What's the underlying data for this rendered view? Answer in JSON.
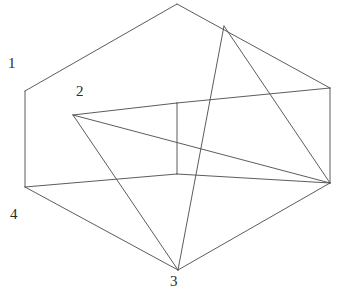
{
  "figure": {
    "type": "line-diagram",
    "canvas": {
      "width": 337,
      "height": 296,
      "background": "#ffffff"
    },
    "stroke_color": "#4a4a4a",
    "label_color": "#2b2b2b",
    "labels": [
      {
        "id": "label-1",
        "text": "1",
        "x": 8,
        "y": 56
      },
      {
        "id": "label-2",
        "text": "2",
        "x": 76,
        "y": 84
      },
      {
        "id": "label-3",
        "text": "3",
        "x": 170,
        "y": 274
      },
      {
        "id": "label-4",
        "text": "4",
        "x": 10,
        "y": 207
      }
    ],
    "vertices": {
      "top_apex": [
        177,
        4
      ],
      "outer_left_top": [
        25,
        91
      ],
      "outer_right_top": [
        330,
        88
      ],
      "outer_left_bottom": [
        25,
        187
      ],
      "outer_right_bottom": [
        330,
        183
      ],
      "bottom_apex": [
        178,
        270
      ],
      "inner_top": [
        177,
        103
      ],
      "inner_bottom": [
        177,
        174
      ],
      "rim_left_point": [
        73,
        115
      ],
      "rim_right_point": [
        224,
        26
      ]
    },
    "polylines": [
      {
        "name": "rim-top-left",
        "points": "25,91 177,4"
      },
      {
        "name": "rim-top-right",
        "points": "177,4 330,88"
      },
      {
        "name": "rim-left-vertical",
        "points": "25,91 25,187"
      },
      {
        "name": "rim-right-vertical",
        "points": "330,88 330,183"
      },
      {
        "name": "base-left",
        "points": "25,187 178,270"
      },
      {
        "name": "base-right",
        "points": "178,270 330,183"
      },
      {
        "name": "inner-rim-left",
        "points": "73,115 177,103"
      },
      {
        "name": "inner-rim-right",
        "points": "177,103 330,88"
      },
      {
        "name": "inner-floor-left",
        "points": "25,187 177,174"
      },
      {
        "name": "inner-floor-right",
        "points": "177,174 330,183"
      },
      {
        "name": "inner-vertical",
        "points": "177,103 177,174"
      },
      {
        "name": "diagonal-rimleft-to-bottomapex",
        "points": "73,115 178,270"
      },
      {
        "name": "diagonal-rimleft-to-rightbottom",
        "points": "73,115 330,183"
      },
      {
        "name": "diagonal-rimright-to-bottomapex",
        "points": "224,26 178,270"
      },
      {
        "name": "diagonal-rimright-to-rightbottom",
        "points": "224,26 330,183"
      }
    ]
  }
}
